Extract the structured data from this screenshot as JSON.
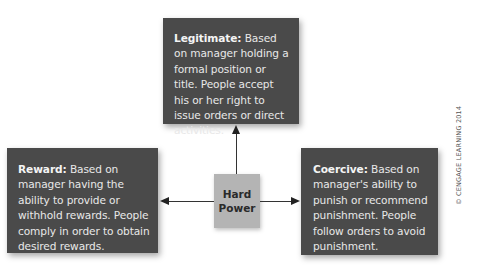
{
  "diagram": {
    "center": {
      "line1": "Hard",
      "line2": "Power"
    },
    "boxes": {
      "legitimate": {
        "term": "Legitimate:",
        "description": " Based on manager holding a formal position or title. People accept his or her right to issue orders or direct activities."
      },
      "reward": {
        "term": "Reward:",
        "description": " Based on manager having the ability to provide or withhold rewards. People comply in order to obtain desired rewards."
      },
      "coercive": {
        "term": "Coercive:",
        "description": " Based on manager's ability to punish or recommend punishment. People follow orders to avoid punishment."
      }
    },
    "arrows": [
      {
        "from": "Hard Power",
        "to": "Legitimate",
        "direction": "up"
      },
      {
        "from": "Hard Power",
        "to": "Reward",
        "direction": "left"
      },
      {
        "from": "Hard Power",
        "to": "Coercive",
        "direction": "right"
      }
    ],
    "colors": {
      "box_fill": "#4a4a4a",
      "box_text": "#e8e8e8",
      "center_fill": "#b4b4b4",
      "center_text": "#2a2a2a",
      "arrow": "#333333"
    },
    "copyright": "© CENGAGE LEARNING 2014"
  }
}
